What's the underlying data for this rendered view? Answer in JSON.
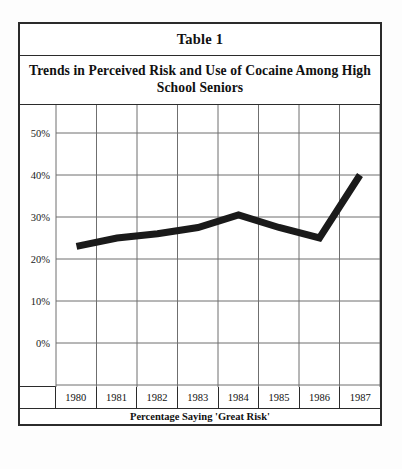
{
  "table": {
    "number_label": "Table 1",
    "title": "Trends in Perceived Risk and Use of Cocaine Among High School Seniors",
    "footer_caption": "Percentage Saying 'Great Risk'"
  },
  "axis": {
    "y_ticks": [
      "50%",
      "40%",
      "30%",
      "20%",
      "10%",
      "0%"
    ],
    "x_ticks": [
      "1980",
      "1981",
      "1982",
      "1983",
      "1984",
      "1985",
      "1986",
      "1987"
    ]
  },
  "colors": {
    "border": "#2b2b2b",
    "grid": "#6f6f6f",
    "line": "#1a1a1a",
    "background": "#ffffff"
  },
  "chart_data": {
    "type": "line",
    "title": "Trends in Perceived Risk and Use of Cocaine Among High School Seniors",
    "subtitle": "Percentage Saying 'Great Risk'",
    "xlabel": "",
    "ylabel": "",
    "categories": [
      "1980",
      "1981",
      "1982",
      "1983",
      "1984",
      "1985",
      "1986",
      "1987"
    ],
    "values": [
      33,
      35,
      36,
      37.5,
      40.5,
      37.5,
      35,
      50
    ],
    "series": [
      {
        "name": "Percentage Saying 'Great Risk'",
        "values": [
          33,
          35,
          36,
          37.5,
          40.5,
          37.5,
          35,
          50
        ]
      }
    ],
    "ylim": [
      0,
      55
    ],
    "y_tick_values": [
      0,
      10,
      20,
      30,
      40,
      50
    ],
    "y_tick_labels": [
      "0%",
      "10%",
      "20%",
      "30%",
      "40%",
      "50%"
    ],
    "grid": true,
    "legend": false,
    "legend_position": "none",
    "line_color": "#1a1a1a",
    "line_width_px": 7
  }
}
